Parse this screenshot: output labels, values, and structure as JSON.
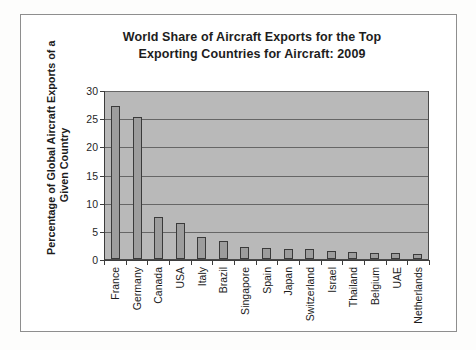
{
  "figure": {
    "title_line1": "World Share of Aircraft Exports for the Top",
    "title_line2": "Exporting Countries for Aircraft: 2009",
    "ylabel_line1": "Percentage of Global Aircraft Exports of a",
    "ylabel_line2": "Given Country",
    "frame_color": "#8e8e8e",
    "plot_background": "#b9b9b9",
    "bar_fill": "#9d9d9d",
    "bar_outline": "#3a3a3a",
    "gridline_color": "#666666"
  },
  "chart_data": {
    "type": "bar",
    "title": "World Share of Aircraft Exports for the Top Exporting Countries for Aircraft: 2009",
    "xlabel": "",
    "ylabel": "Percentage of Global Aircraft Exports of a Given Country",
    "categories": [
      "France",
      "Germany",
      "Canada",
      "USA",
      "Italy",
      "Brazil",
      "Singapore",
      "Spain",
      "Japan",
      "Switzerland",
      "Israel",
      "Thailand",
      "Belgium",
      "UAE",
      "Netherlands"
    ],
    "values": [
      27.2,
      25.2,
      7.4,
      6.4,
      3.9,
      3.2,
      2.1,
      1.9,
      1.8,
      1.8,
      1.4,
      1.3,
      1.1,
      1.0,
      0.9
    ],
    "ylim": [
      0,
      30
    ],
    "yticks": [
      0,
      5,
      10,
      15,
      20,
      25,
      30
    ],
    "ytick_labels": [
      "0",
      "5",
      "10",
      "15",
      "20",
      "25",
      "30"
    ],
    "grid": true,
    "legend": false,
    "series": [
      {
        "name": "World share of aircraft exports (%)",
        "values": [
          27.2,
          25.2,
          7.4,
          6.4,
          3.9,
          3.2,
          2.1,
          1.9,
          1.8,
          1.8,
          1.4,
          1.3,
          1.1,
          1.0,
          0.9
        ]
      }
    ]
  }
}
